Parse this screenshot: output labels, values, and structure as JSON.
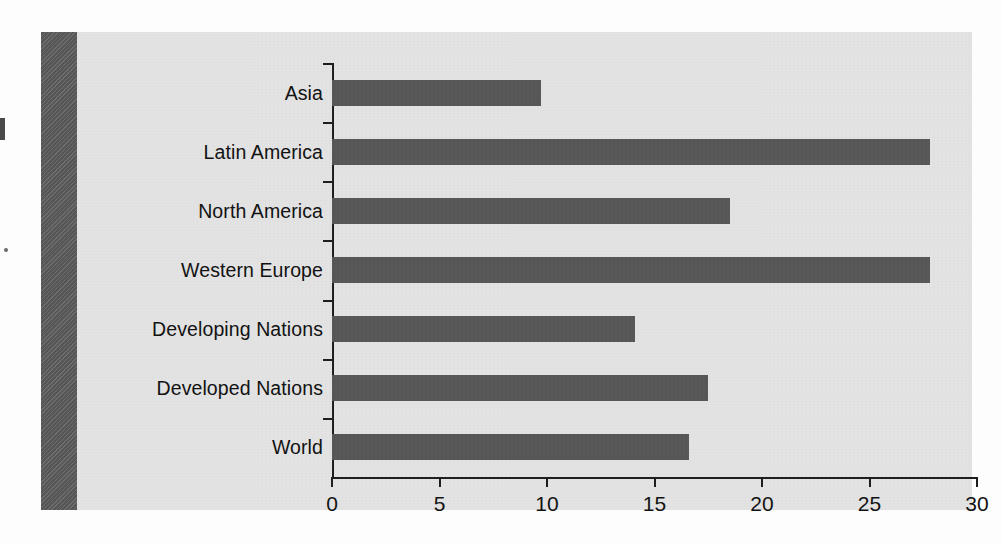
{
  "chart_data": {
    "type": "bar",
    "orientation": "horizontal",
    "title": "",
    "subtitle": "",
    "xlabel": "",
    "ylabel": "",
    "categories": [
      "Asia",
      "Latin America",
      "North America",
      "Western Europe",
      "Developing Nations",
      "Developed Nations",
      "World"
    ],
    "values": [
      9.7,
      27.8,
      18.5,
      27.8,
      14.1,
      17.5,
      16.6
    ],
    "xlim": [
      0,
      30
    ],
    "xticks": [
      0,
      5,
      10,
      15,
      20,
      25,
      30
    ],
    "xtick_labels": [
      "0",
      "5",
      "10",
      "15",
      "20",
      "25",
      "30"
    ],
    "grid": false,
    "legend": null,
    "legend_position": "none",
    "annotations": []
  },
  "style": {
    "panel_background": "#e4e4e4",
    "gutter_band_color": "#5c5c5c",
    "bar_color": "#575757",
    "axis_color": "#1d1d1d",
    "text_color": "#111111",
    "page_background": "#fdfdfd"
  },
  "icons": {
    "scan_mark_top": "scan-registration-mark",
    "scan_mark_dot": "scan-speck"
  }
}
